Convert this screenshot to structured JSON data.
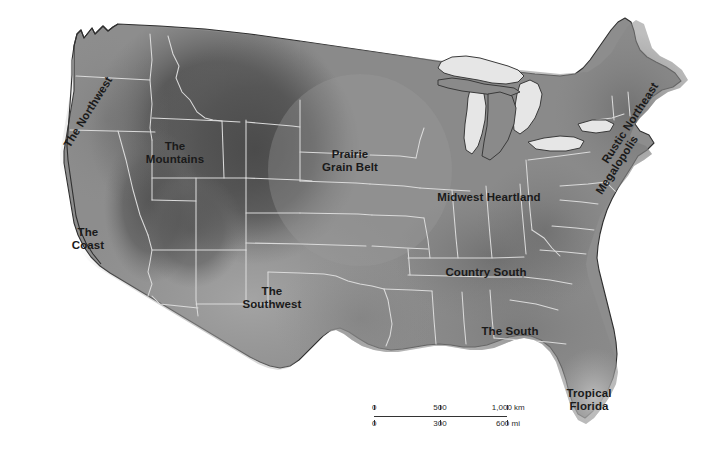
{
  "map": {
    "title": "United States cultural regions map",
    "background_color": "#ffffff",
    "land_colors": {
      "lightest": "#b4b4b4",
      "light": "#9a9a9a",
      "mid": "#8a8a8a",
      "dark": "#6f6f6f",
      "darkest": "#4f4f4f",
      "lake": "#e4e4e4",
      "border": "#d9d9d9",
      "outline": "#3a3a3a"
    },
    "regions": [
      {
        "id": "the-northwest",
        "label": "The Northwest",
        "x": 88,
        "y": 112,
        "rotate": -58,
        "lines": 1
      },
      {
        "id": "the-mountains",
        "label": "The\nMountains",
        "x": 175,
        "y": 152,
        "rotate": 0,
        "lines": 2
      },
      {
        "id": "the-coast",
        "label": "The\nCoast",
        "x": 88,
        "y": 238,
        "rotate": 0,
        "lines": 2
      },
      {
        "id": "the-southwest",
        "label": "The\nSouthwest",
        "x": 272,
        "y": 297,
        "rotate": 0,
        "lines": 2
      },
      {
        "id": "prairie-grain-belt",
        "label": "Prairie\nGrain Belt",
        "x": 350,
        "y": 160,
        "rotate": 0,
        "lines": 2
      },
      {
        "id": "midwest-heartland",
        "label": "Midwest Heartland",
        "x": 489,
        "y": 197,
        "rotate": 0,
        "lines": 1
      },
      {
        "id": "country-south",
        "label": "Country South",
        "x": 486,
        "y": 272,
        "rotate": 0,
        "lines": 1
      },
      {
        "id": "the-south",
        "label": "The South",
        "x": 510,
        "y": 331,
        "rotate": 0,
        "lines": 1
      },
      {
        "id": "tropical-florida",
        "label": "Tropical\nFlorida",
        "x": 589,
        "y": 399,
        "rotate": 0,
        "lines": 2
      },
      {
        "id": "rustic-northeast",
        "label": "Rustic Northeast",
        "x": 630,
        "y": 123,
        "rotate": -57,
        "lines": 1
      },
      {
        "id": "megalopolis",
        "label": "Megalopolis",
        "x": 620,
        "y": 163,
        "rotate": -57,
        "lines": 1
      }
    ]
  },
  "scale_bar": {
    "km": {
      "ticks": [
        "0",
        "500",
        "1,000 km"
      ],
      "unit": "km",
      "max": 1000
    },
    "mi": {
      "ticks": [
        "0",
        "300",
        "600 mi"
      ],
      "unit": "mi",
      "max": 600
    }
  }
}
